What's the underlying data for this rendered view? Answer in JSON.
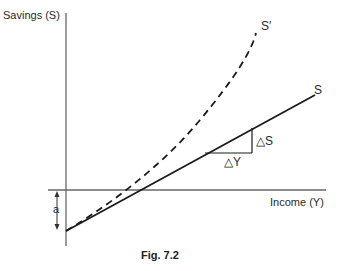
{
  "figure": {
    "caption": "Fig. 7.2",
    "y_axis_label": "Savings (S)",
    "x_axis_label": "Income (Y)",
    "curves": [
      {
        "name": "S",
        "label": "S",
        "style": "solid",
        "description": "Linear savings function"
      },
      {
        "name": "S-prime",
        "label": "S′",
        "style": "dashed",
        "description": "Convex savings function"
      }
    ],
    "annotations": {
      "delta_s": "△S",
      "delta_y": "△Y",
      "intercept": "a"
    },
    "colors": {
      "line": "#1a1a1a",
      "axis": "#555555",
      "background": "#ffffff"
    }
  }
}
